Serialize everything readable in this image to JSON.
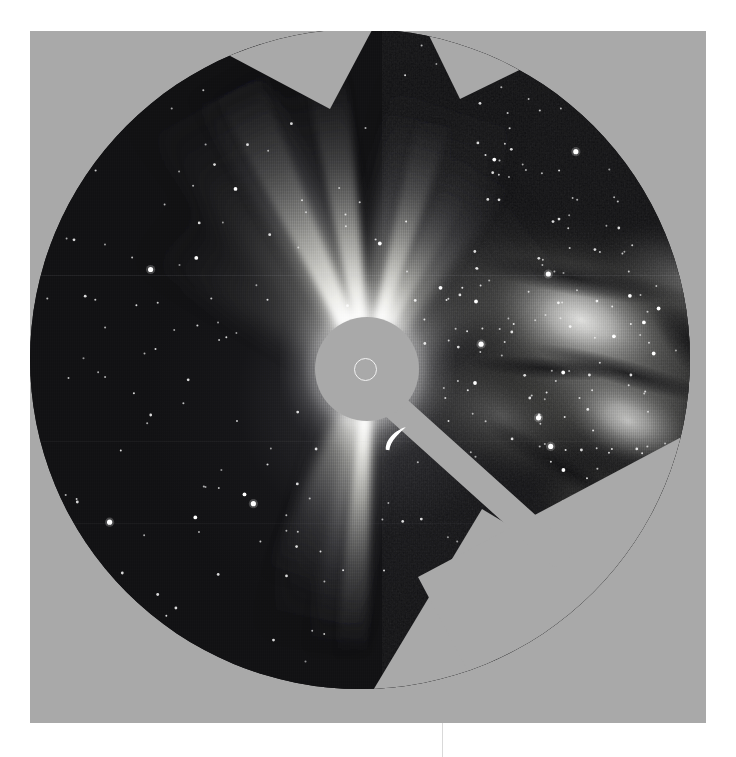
{
  "image": {
    "kind": "astronomical-photograph",
    "instrument_label": "SOHO LASCO C3 coronagraph",
    "subject": "solar corona with occulting disk, pylon and Milky Way star field",
    "plate": {
      "left": 30,
      "top": 31,
      "width": 676,
      "height": 692,
      "background_color": "#a9a9a9",
      "page_background_color": "#ffffff"
    },
    "field_of_view": {
      "shape": "circle",
      "center_x": 330,
      "center_y": 328,
      "radius": 330,
      "sky_color_dark": "#121214",
      "sky_color_bright": "#7d7d82"
    },
    "occulter": {
      "disk_center_x": 337,
      "disk_center_y": 340,
      "disk_radius": 52,
      "disk_color": "#a9a9a9",
      "pylon_angle_deg": 42,
      "pylon_length": 270,
      "pylon_width": 27,
      "sun_marker_center_x": 336,
      "sun_marker_center_y": 341,
      "sun_marker_radius": 11.5,
      "sun_marker_color": "#f2f2f2"
    },
    "register_line": {
      "x": 442,
      "y_top": 723,
      "y_bottom": 757,
      "color": "#d9d9d9"
    }
  },
  "chart_data": {
    "type": "scatter",
    "xlabel": "",
    "ylabel": "",
    "streamers": [
      {
        "name": "north streamer",
        "angle_deg": -8,
        "length": 300,
        "width": 26,
        "peak_brightness": 1.0
      },
      {
        "name": "north-east streamer",
        "angle_deg": -26,
        "length": 315,
        "width": 34,
        "peak_brightness": 0.92
      },
      {
        "name": "north-north-east fan",
        "angle_deg": -34,
        "length": 330,
        "width": 72,
        "peak_brightness": 0.62
      },
      {
        "name": "north-west streamer",
        "angle_deg": 16,
        "length": 270,
        "width": 26,
        "peak_brightness": 0.85
      },
      {
        "name": "north-west fan",
        "angle_deg": 30,
        "length": 240,
        "width": 46,
        "peak_brightness": 0.5
      },
      {
        "name": "west fan",
        "angle_deg": 52,
        "length": 180,
        "width": 48,
        "peak_brightness": 0.34
      },
      {
        "name": "east outer fan",
        "angle_deg": -48,
        "length": 210,
        "width": 54,
        "peak_brightness": 0.3
      },
      {
        "name": "south streamer",
        "angle_deg": 183,
        "length": 290,
        "width": 24,
        "peak_brightness": 0.95
      },
      {
        "name": "south-west fan",
        "angle_deg": 196,
        "length": 230,
        "width": 52,
        "peak_brightness": 0.4
      }
    ],
    "milky_way": {
      "position": "right of field",
      "band_angle_deg": 22,
      "bright_core_x": 555,
      "bright_core_y": 315,
      "dust_lanes": 5
    },
    "bright_features": [
      {
        "name": "crescent artefact",
        "x": 366,
        "y": 410,
        "length": 30,
        "brightness": 1.0
      }
    ],
    "star_count_drawn": 420
  }
}
